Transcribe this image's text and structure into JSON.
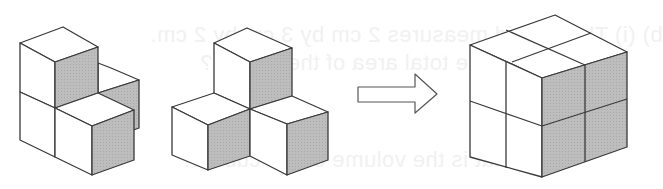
{
  "figure": {
    "colors": {
      "background": "#ffffff",
      "top_face": "#ffffff",
      "left_face": "#ffffff",
      "shaded_face": "#bdbdbd",
      "edge": "#3a3a3a",
      "show_through_text": "#f1f1f1"
    },
    "pieces": [
      {
        "id": "solid-a",
        "cube_count": 4,
        "shape": "L-shaped stack of cubes"
      },
      {
        "id": "solid-b",
        "cube_count": 4,
        "shape": "three-lobed arrangement of cubes"
      }
    ],
    "arrow": {
      "direction": "right",
      "style": "outline block arrow"
    },
    "result": {
      "id": "composite-cube",
      "dimensions": "2 x 2 x 2",
      "cube_count": 8
    }
  },
  "show_through": {
    "line1": "b) (i) The cuboid measures 2 cm by 3 cm by 2 cm.",
    "line2": "What is the total area of the cuboid?",
    "line3": "(ii) What is the volume of the cuboid?"
  }
}
